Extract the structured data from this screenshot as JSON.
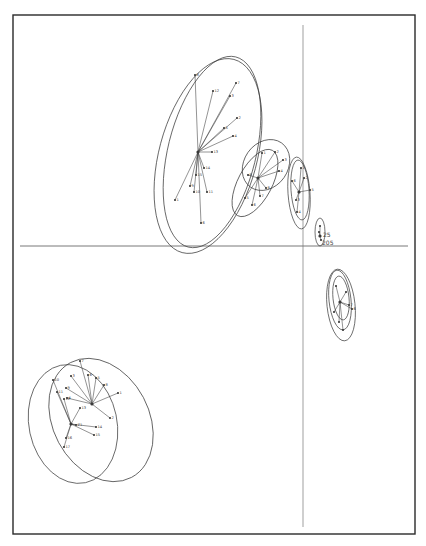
{
  "figure": {
    "frame": {
      "x": 13,
      "y": 15,
      "w": 402,
      "h": 519,
      "stroke": "#2a2a2a",
      "stroke_width": 1.4
    },
    "background": "#ffffff",
    "ink": "#3a3a3a"
  },
  "chart_data": {
    "type": "scatter",
    "title": "",
    "xlabel": "",
    "ylabel": "",
    "grid": false,
    "legend": "none",
    "axes": {
      "horizontal": {
        "y": 246,
        "x1": 20,
        "x2": 408
      },
      "vertical": {
        "x": 303,
        "y1": 25,
        "y2": 527
      }
    },
    "annotations": [
      {
        "text": "25",
        "x": 323,
        "y": 237
      },
      {
        "text": "205",
        "x": 322,
        "y": 245
      }
    ],
    "groups": [
      {
        "name": "group-large-upper",
        "ellipses": [
          {
            "cx": 208,
            "cy": 156,
            "rx": 49,
            "ry": 100,
            "rot": 15
          },
          {
            "cx": 212,
            "cy": 152,
            "rx": 44,
            "ry": 98,
            "rot": 14
          }
        ],
        "centroid": {
          "x": 198,
          "y": 152
        },
        "points": [
          {
            "x": 195,
            "y": 75,
            "label": "8"
          },
          {
            "x": 213,
            "y": 91,
            "label": "12"
          },
          {
            "x": 236,
            "y": 83,
            "label": "7"
          },
          {
            "x": 230,
            "y": 96,
            "label": "3"
          },
          {
            "x": 237,
            "y": 118,
            "label": "2"
          },
          {
            "x": 224,
            "y": 128,
            "label": "5"
          },
          {
            "x": 233,
            "y": 136,
            "label": "4"
          },
          {
            "x": 175,
            "y": 200,
            "label": "1"
          },
          {
            "x": 201,
            "y": 223,
            "label": "6"
          },
          {
            "x": 190,
            "y": 186,
            "label": "9"
          },
          {
            "x": 194,
            "y": 192,
            "label": "10"
          },
          {
            "x": 207,
            "y": 192,
            "label": "11"
          },
          {
            "x": 212,
            "y": 152,
            "label": "13"
          },
          {
            "x": 204,
            "y": 168,
            "label": "14"
          },
          {
            "x": 196,
            "y": 175,
            "label": "15"
          }
        ]
      },
      {
        "name": "group-mid-upper",
        "ellipses": [
          {
            "cx": 266,
            "cy": 165,
            "rx": 22,
            "ry": 27,
            "rot": 35
          },
          {
            "cx": 255,
            "cy": 183,
            "rx": 17,
            "ry": 37,
            "rot": 28
          }
        ],
        "centroid": {
          "x": 258,
          "y": 178
        },
        "points": [
          {
            "x": 262,
            "y": 153,
            "label": "1"
          },
          {
            "x": 275,
            "y": 152,
            "label": "2"
          },
          {
            "x": 283,
            "y": 160,
            "label": "3"
          },
          {
            "x": 279,
            "y": 171,
            "label": "4"
          },
          {
            "x": 245,
            "y": 198,
            "label": "5"
          },
          {
            "x": 252,
            "y": 205,
            "label": "6"
          },
          {
            "x": 260,
            "y": 196,
            "label": "7"
          },
          {
            "x": 266,
            "y": 188,
            "label": "8"
          },
          {
            "x": 248,
            "y": 175,
            "label": "9"
          }
        ]
      },
      {
        "name": "group-axis-right",
        "ellipses": [
          {
            "cx": 299,
            "cy": 193,
            "rx": 11,
            "ry": 36,
            "rot": -4
          },
          {
            "cx": 300,
            "cy": 190,
            "rx": 9,
            "ry": 30,
            "rot": -4
          }
        ],
        "centroid": {
          "x": 299,
          "y": 192
        },
        "points": [
          {
            "x": 301,
            "y": 168,
            "label": "1"
          },
          {
            "x": 304,
            "y": 178,
            "label": "2"
          },
          {
            "x": 296,
            "y": 200,
            "label": "3"
          },
          {
            "x": 297,
            "y": 212,
            "label": "4"
          },
          {
            "x": 310,
            "y": 190,
            "label": "5"
          },
          {
            "x": 292,
            "y": 181,
            "label": "6"
          }
        ]
      },
      {
        "name": "group-small-axis",
        "ellipses": [
          {
            "cx": 320,
            "cy": 232,
            "rx": 5,
            "ry": 14,
            "rot": 0
          }
        ],
        "centroid": {
          "x": 320,
          "y": 236
        },
        "points": [
          {
            "x": 320,
            "y": 226,
            "label": ""
          },
          {
            "x": 321,
            "y": 240,
            "label": ""
          },
          {
            "x": 319,
            "y": 232,
            "label": ""
          }
        ]
      },
      {
        "name": "group-right-lower",
        "ellipses": [
          {
            "cx": 341,
            "cy": 305,
            "rx": 14,
            "ry": 36,
            "rot": -6
          },
          {
            "cx": 340,
            "cy": 300,
            "rx": 11,
            "ry": 30,
            "rot": -6
          },
          {
            "cx": 341,
            "cy": 298,
            "rx": 8,
            "ry": 22,
            "rot": -6
          }
        ],
        "centroid": {
          "x": 340,
          "y": 302
        },
        "points": [
          {
            "x": 336,
            "y": 286,
            "label": ""
          },
          {
            "x": 346,
            "y": 292,
            "label": ""
          },
          {
            "x": 349,
            "y": 305,
            "label": "7"
          },
          {
            "x": 352,
            "y": 309,
            "label": "6"
          },
          {
            "x": 334,
            "y": 312,
            "label": ""
          },
          {
            "x": 339,
            "y": 322,
            "label": ""
          },
          {
            "x": 343,
            "y": 330,
            "label": ""
          }
        ]
      },
      {
        "name": "group-lower-left-a",
        "ellipses": [
          {
            "cx": 101,
            "cy": 420,
            "rx": 48,
            "ry": 65,
            "rot": -28
          }
        ],
        "centroid": {
          "x": 92,
          "y": 404
        },
        "points": [
          {
            "x": 80,
            "y": 361,
            "label": "7"
          },
          {
            "x": 71,
            "y": 376,
            "label": "3"
          },
          {
            "x": 88,
            "y": 375,
            "label": "6"
          },
          {
            "x": 96,
            "y": 378,
            "label": "5"
          },
          {
            "x": 104,
            "y": 385,
            "label": "8"
          },
          {
            "x": 118,
            "y": 393,
            "label": "1"
          },
          {
            "x": 110,
            "y": 418,
            "label": "2"
          },
          {
            "x": 66,
            "y": 388,
            "label": "9"
          },
          {
            "x": 67,
            "y": 398,
            "label": "4"
          }
        ]
      },
      {
        "name": "group-lower-left-b",
        "ellipses": [
          {
            "cx": 73,
            "cy": 424,
            "rx": 44,
            "ry": 60,
            "rot": -12
          }
        ],
        "centroid": {
          "x": 71,
          "y": 424
        },
        "points": [
          {
            "x": 53,
            "y": 380,
            "label": "10"
          },
          {
            "x": 57,
            "y": 392,
            "label": "11"
          },
          {
            "x": 64,
            "y": 399,
            "label": "12"
          },
          {
            "x": 80,
            "y": 408,
            "label": "13"
          },
          {
            "x": 96,
            "y": 427,
            "label": "14"
          },
          {
            "x": 94,
            "y": 435,
            "label": "15"
          },
          {
            "x": 66,
            "y": 438,
            "label": "16"
          },
          {
            "x": 64,
            "y": 447,
            "label": "17"
          },
          {
            "x": 76,
            "y": 425,
            "label": "Z1"
          }
        ]
      }
    ]
  }
}
